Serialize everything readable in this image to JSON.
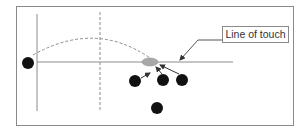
{
  "diagram": {
    "title": "",
    "label_line_of_touch": "Line of touch",
    "colors": {
      "frame": "#8a8a8a",
      "lines": "#8c8c8c",
      "dashed": "#8c8c8c",
      "players": "#111111",
      "ball": "#a8a8a8"
    },
    "elements": {
      "frame": {
        "x": 16,
        "y": 6,
        "w": 278,
        "h": 120
      },
      "sideline": {
        "x": 37,
        "y1": 14,
        "y2": 111
      },
      "dashed_vertical": {
        "x": 100,
        "y1": 12,
        "y2": 111
      },
      "line_of_touch": {
        "y": 62,
        "x1": 37,
        "x2": 233
      },
      "thrower": {
        "cx": 28,
        "cy": 63,
        "r": 6
      },
      "ball": {
        "cx": 150,
        "cy": 62,
        "rx": 8,
        "ry": 4
      },
      "players": [
        {
          "cx": 135,
          "cy": 81,
          "r": 6
        },
        {
          "cx": 163,
          "cy": 80,
          "r": 6
        },
        {
          "cx": 182,
          "cy": 80,
          "r": 6
        },
        {
          "cx": 157,
          "cy": 108,
          "r": 6
        }
      ]
    }
  }
}
